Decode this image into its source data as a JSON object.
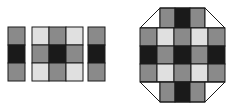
{
  "meta": {
    "background": "#ffffff",
    "width": 241,
    "height": 111
  },
  "palette": {
    "dark": "#1a1a1a",
    "mid": "#8a8a8a",
    "light": "#e0e0e0",
    "stroke": "#1a1a1a",
    "background": "#ffffff"
  },
  "chart_data": {
    "type": "heatmap",
    "xlabel": "",
    "ylabel": "",
    "legend": [],
    "figures": [
      {
        "name": "left-figure",
        "panels": [
          {
            "name": "left-side-strip",
            "rows": 3,
            "cols": 1,
            "values": [
              [
                "mid"
              ],
              [
                "dark"
              ],
              [
                "mid"
              ]
            ]
          },
          {
            "name": "center-face",
            "rows": 3,
            "cols": 3,
            "values": [
              [
                "light",
                "mid",
                "light"
              ],
              [
                "mid",
                "dark",
                "mid"
              ],
              [
                "light",
                "mid",
                "light"
              ]
            ]
          },
          {
            "name": "right-side-strip",
            "rows": 3,
            "cols": 1,
            "values": [
              [
                "mid"
              ],
              [
                "dark"
              ],
              [
                "mid"
              ]
            ]
          }
        ]
      },
      {
        "name": "right-figure",
        "panels": [
          {
            "name": "top-flap",
            "rows": 1,
            "cols": 3,
            "values": [
              [
                "mid",
                "dark",
                "mid"
              ]
            ]
          },
          {
            "name": "center-face",
            "rows": 3,
            "cols": 5,
            "values": [
              [
                "mid",
                "light",
                "mid",
                "light",
                "mid"
              ],
              [
                "dark",
                "mid",
                "dark",
                "mid",
                "dark"
              ],
              [
                "mid",
                "light",
                "mid",
                "light",
                "mid"
              ]
            ]
          },
          {
            "name": "bottom-flap",
            "rows": 1,
            "cols": 3,
            "values": [
              [
                "mid",
                "dark",
                "mid"
              ]
            ]
          }
        ]
      }
    ]
  }
}
